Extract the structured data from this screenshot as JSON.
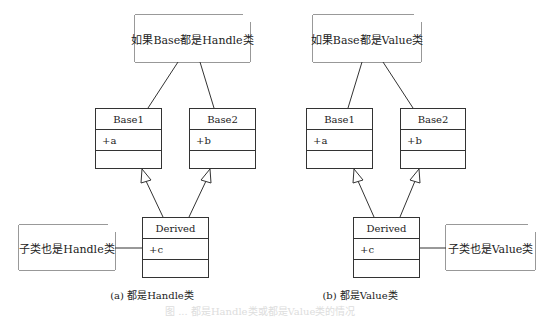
{
  "left": {
    "note_top": "如果Base都是Handle类",
    "base1": {
      "name": "Base1",
      "attr": "+a"
    },
    "base2": {
      "name": "Base2",
      "attr": "+b"
    },
    "derived": {
      "name": "Derived",
      "attr": "+c"
    },
    "note_side": "子类也是Handle类",
    "caption": "(a) 都是Handle类"
  },
  "right": {
    "note_top": "如果Base都是Value类",
    "base1": {
      "name": "Base1",
      "attr": "+a"
    },
    "base2": {
      "name": "Base2",
      "attr": "+b"
    },
    "derived": {
      "name": "Derived",
      "attr": "+c"
    },
    "note_side": "子类也是Value类",
    "caption": "(b) 都是Value类"
  },
  "figure_caption": "图 ... 都是Handle类或都是Value类的情况"
}
